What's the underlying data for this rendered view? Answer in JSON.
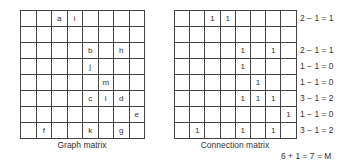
{
  "graph_matrix": {
    "caption": "Graph matrix",
    "rows": [
      [
        "",
        "",
        "a",
        "i",
        "",
        "",
        "",
        ""
      ],
      [
        "",
        "",
        "",
        "",
        "",
        "",
        "",
        ""
      ],
      [
        "",
        "",
        "",
        "",
        "b",
        "",
        "h",
        ""
      ],
      [
        "",
        "",
        "",
        "",
        "j",
        "",
        "",
        ""
      ],
      [
        "",
        "",
        "",
        "",
        "",
        "m",
        "",
        ""
      ],
      [
        "",
        "",
        "",
        "",
        "c",
        "l",
        "d",
        ""
      ],
      [
        "",
        "",
        "",
        "",
        "",
        "",
        "",
        "e"
      ],
      [
        "",
        "f",
        "",
        "",
        "k",
        "",
        "g",
        ""
      ]
    ]
  },
  "connection_matrix": {
    "caption": "Connection matrix",
    "rows": [
      [
        "",
        "",
        "1",
        "1",
        "",
        "",
        "",
        ""
      ],
      [
        "",
        "",
        "",
        "",
        "",
        "",
        "",
        ""
      ],
      [
        "",
        "",
        "",
        "",
        "1",
        "",
        "1",
        ""
      ],
      [
        "",
        "",
        "",
        "",
        "1",
        "",
        "",
        ""
      ],
      [
        "",
        "",
        "",
        "",
        "",
        "1",
        "",
        ""
      ],
      [
        "",
        "",
        "",
        "",
        "1",
        "1",
        "1",
        ""
      ],
      [
        "",
        "",
        "",
        "",
        "",
        "",
        "",
        "1"
      ],
      [
        "",
        "1",
        "",
        "",
        "1",
        "",
        "1",
        ""
      ]
    ]
  },
  "row_equations": [
    "2 − 1 = 1",
    "",
    "2 − 1 = 1",
    "1 − 1 = 0",
    "1 − 1 = 0",
    "3 − 1 = 2",
    "1 − 1 = 0",
    "3 − 1 = 2"
  ],
  "total": "6 + 1 = 7 = M"
}
